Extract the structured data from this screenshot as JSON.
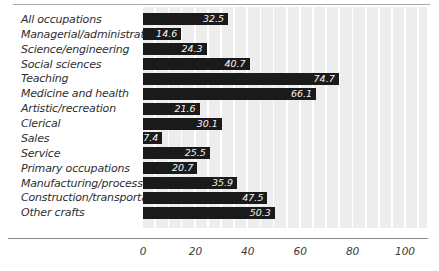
{
  "chart_data": {
    "type": "bar",
    "orientation": "horizontal",
    "title": "",
    "xlabel": "",
    "ylabel": "",
    "categories": [
      "All occupations",
      "Managerial/administrative",
      "Science/engineering",
      "Social sciences",
      "Teaching",
      "Medicine and health",
      "Artistic/recreation",
      "Clerical",
      "Sales",
      "Service",
      "Primary occupations",
      "Manufacturing/processing",
      "Construction/transportation",
      "Other crafts"
    ],
    "values": [
      32.5,
      14.6,
      24.3,
      40.7,
      74.7,
      66.1,
      21.6,
      30.1,
      7.4,
      25.5,
      20.7,
      35.9,
      47.5,
      50.3
    ],
    "value_labels_shown": true,
    "x_ticks": [
      0,
      20,
      40,
      60,
      80,
      100
    ],
    "xlim": [
      0,
      108.4
    ],
    "grid": "vertical-white-lines-every-5-units",
    "legend": "none",
    "colors": {
      "bar": "#1a1a1a",
      "value_label_text": "#f4f4f4",
      "plot_background": "#ededed",
      "gridline": "#ffffff",
      "category_label_text": "#2e2e2e",
      "tick_label_text": "#3a3a3a",
      "axis_line": "#8a8a8a",
      "top_rule": "#aaaaaa",
      "page_background": "#ffffff"
    }
  }
}
